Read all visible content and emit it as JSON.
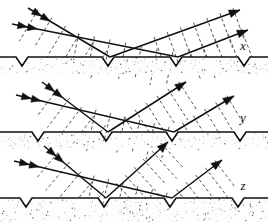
{
  "figure": {
    "type": "optics-ray-wavefront-diagram",
    "width": 268,
    "height": 222,
    "background_color": "#ffffff",
    "ink_color": "#111111",
    "wavefront_color": "#555555",
    "ground_fill": "#fdfdfd",
    "stipple_color": "#3a3a3a"
  },
  "panels": [
    {
      "id": "panel-x",
      "label": "x",
      "label_x": 243,
      "label_y": 50,
      "surface_y": 57,
      "ground_bottom": 74,
      "notches": [
        {
          "x": 22,
          "width": 12,
          "depth": 9
        },
        {
          "x": 108,
          "width": 12,
          "depth": 9
        },
        {
          "x": 176,
          "width": 12,
          "depth": 9
        },
        {
          "x": 244,
          "width": 12,
          "depth": 9
        }
      ],
      "incident_rays": [
        {
          "x1": 28,
          "y1": 8,
          "x2": 110,
          "y2": 57,
          "arrowheads": 2
        },
        {
          "x1": 12,
          "y1": 24,
          "x2": 178,
          "y2": 57,
          "arrowheads": 2
        }
      ],
      "reflected_rays": [
        {
          "x1": 110,
          "y1": 57,
          "x2": 240,
          "y2": 10,
          "arrowheads": 1
        },
        {
          "x1": 178,
          "y1": 57,
          "x2": 248,
          "y2": 30,
          "arrowheads": 1
        }
      ],
      "incident_wavefronts": 7,
      "reflected_wavefronts": 7,
      "wavefront_spacing_in": 16,
      "wavefront_spacing_out": 14
    },
    {
      "id": "panel-y",
      "label": "y",
      "label_x": 243,
      "label_y": 122,
      "surface_y": 132,
      "ground_bottom": 149,
      "notches": [
        {
          "x": 38,
          "width": 12,
          "depth": 9
        },
        {
          "x": 106,
          "width": 12,
          "depth": 9
        },
        {
          "x": 172,
          "width": 12,
          "depth": 9
        },
        {
          "x": 240,
          "width": 12,
          "depth": 9
        }
      ],
      "incident_rays": [
        {
          "x1": 42,
          "y1": 82,
          "x2": 108,
          "y2": 132,
          "arrowheads": 2
        },
        {
          "x1": 16,
          "y1": 95,
          "x2": 174,
          "y2": 132,
          "arrowheads": 2
        }
      ],
      "reflected_rays": [
        {
          "x1": 108,
          "y1": 132,
          "x2": 186,
          "y2": 82,
          "arrowheads": 1
        },
        {
          "x1": 174,
          "y1": 132,
          "x2": 234,
          "y2": 96,
          "arrowheads": 1
        }
      ],
      "incident_wavefronts": 6,
      "reflected_wavefronts": 6,
      "wavefront_spacing_in": 15,
      "wavefront_spacing_out": 13
    },
    {
      "id": "panel-z",
      "label": "z",
      "label_x": 243,
      "label_y": 190,
      "surface_y": 198,
      "ground_bottom": 222,
      "notches": [
        {
          "x": 26,
          "width": 12,
          "depth": 9
        },
        {
          "x": 104,
          "width": 12,
          "depth": 9
        },
        {
          "x": 170,
          "width": 12,
          "depth": 9
        },
        {
          "x": 238,
          "width": 12,
          "depth": 9
        }
      ],
      "incident_rays": [
        {
          "x1": 44,
          "y1": 146,
          "x2": 106,
          "y2": 198,
          "arrowheads": 2
        },
        {
          "x1": 14,
          "y1": 161,
          "x2": 172,
          "y2": 198,
          "arrowheads": 2
        }
      ],
      "reflected_rays": [
        {
          "x1": 106,
          "y1": 198,
          "x2": 168,
          "y2": 142,
          "arrowheads": 1
        },
        {
          "x1": 172,
          "y1": 198,
          "x2": 222,
          "y2": 160,
          "arrowheads": 1
        }
      ],
      "incident_wavefronts": 6,
      "reflected_wavefronts": 6,
      "wavefront_spacing_in": 15,
      "wavefront_spacing_out": 12
    }
  ]
}
